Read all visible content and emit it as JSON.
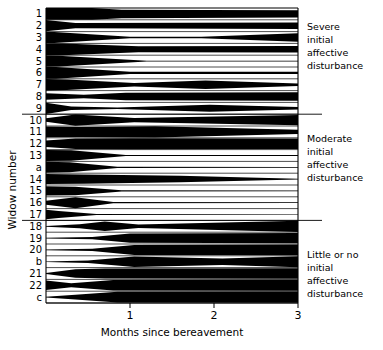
{
  "figure": {
    "title": "",
    "y_axis_title": "Widow number",
    "x_axis_title": "Months since bereavement"
  },
  "annotations": [
    {
      "id": "severe",
      "lines": [
        "Severe",
        "initial",
        "affective",
        "disturbance"
      ]
    },
    {
      "id": "moderate",
      "lines": [
        "Moderate",
        "initial",
        "affective",
        "disturbance"
      ]
    },
    {
      "id": "little",
      "lines": [
        "Little or no",
        "initial",
        "affective",
        "disturbance"
      ]
    }
  ],
  "chart_data": {
    "type": "area",
    "variant": "kite-diagram",
    "title": "",
    "xlabel": "Months since bereavement",
    "ylabel": "Widow number",
    "xlim": [
      0,
      3
    ],
    "xticks": [
      1,
      2,
      3
    ],
    "xticklabels": [
      "1",
      "2",
      "3"
    ],
    "grid": false,
    "legend": null,
    "fill_color": "#000000",
    "groups": [
      {
        "name": "Severe initial affective disturbance",
        "rows": [
          "1",
          "2",
          "3",
          "4",
          "5",
          "6",
          "7",
          "8",
          "9"
        ]
      },
      {
        "name": "Moderate initial affective disturbance",
        "rows": [
          "10",
          "11",
          "12",
          "13",
          "a",
          "14",
          "15",
          "16",
          "17"
        ]
      },
      {
        "name": "Little or no initial affective disturbance",
        "rows": [
          "18",
          "19",
          "20",
          "b",
          "21",
          "22",
          "c"
        ]
      }
    ],
    "series": [
      {
        "name": "1",
        "group": "severe",
        "x": [
          0.0,
          0.55,
          0.9,
          3.0
        ],
        "values": [
          1.0,
          1.0,
          0.72,
          0.6
        ]
      },
      {
        "name": "2",
        "group": "severe",
        "x": [
          0.0,
          0.35,
          3.0
        ],
        "values": [
          0.95,
          0.45,
          0.55
        ]
      },
      {
        "name": "3",
        "group": "severe",
        "x": [
          0.0,
          0.1,
          1.0,
          1.85,
          3.0
        ],
        "values": [
          0.95,
          0.95,
          0.14,
          0.12,
          0.7
        ]
      },
      {
        "name": "4",
        "group": "severe",
        "x": [
          0.0,
          0.2,
          1.1,
          3.0
        ],
        "values": [
          1.0,
          1.0,
          0.5,
          0.55
        ]
      },
      {
        "name": "5",
        "group": "severe",
        "x": [
          0.0,
          0.15,
          1.2,
          3.0
        ],
        "values": [
          0.95,
          0.92,
          0.08,
          0.06
        ]
      },
      {
        "name": "6",
        "group": "severe",
        "x": [
          0.0,
          0.12,
          1.0,
          3.0
        ],
        "values": [
          1.0,
          0.98,
          0.2,
          0.18
        ]
      },
      {
        "name": "7",
        "group": "severe",
        "x": [
          0.0,
          0.25,
          1.05,
          1.9,
          3.0
        ],
        "values": [
          0.98,
          0.9,
          0.3,
          0.72,
          0.22
        ]
      },
      {
        "name": "8",
        "group": "severe",
        "x": [
          0.0,
          0.45,
          0.95,
          3.0
        ],
        "values": [
          0.55,
          0.3,
          0.62,
          0.7
        ]
      },
      {
        "name": "9",
        "group": "severe",
        "x": [
          0.0,
          0.3,
          0.85,
          1.95,
          3.0
        ],
        "values": [
          0.95,
          0.3,
          0.12,
          0.6,
          0.2
        ]
      },
      {
        "name": "10",
        "group": "moderate",
        "x": [
          0.0,
          0.35,
          1.05,
          3.0
        ],
        "values": [
          0.3,
          0.95,
          0.35,
          0.88
        ]
      },
      {
        "name": "11",
        "group": "moderate",
        "x": [
          0.0,
          0.4,
          1.3,
          3.0
        ],
        "values": [
          0.9,
          0.85,
          0.95,
          0.35
        ]
      },
      {
        "name": "12",
        "group": "moderate",
        "x": [
          0.0,
          0.35,
          1.0,
          3.0
        ],
        "values": [
          0.55,
          0.88,
          0.92,
          0.88
        ]
      },
      {
        "name": "13",
        "group": "moderate",
        "x": [
          0.0,
          0.3,
          0.95,
          3.0
        ],
        "values": [
          0.92,
          0.88,
          0.1,
          0.08
        ]
      },
      {
        "name": "a",
        "group": "moderate",
        "x": [
          0.0,
          0.28,
          0.85,
          3.0
        ],
        "values": [
          0.92,
          0.85,
          0.1,
          0.06
        ]
      },
      {
        "name": "14",
        "group": "moderate",
        "x": [
          0.0,
          0.45,
          1.6,
          3.0
        ],
        "values": [
          0.85,
          0.8,
          0.55,
          0.08
        ]
      },
      {
        "name": "15",
        "group": "moderate",
        "x": [
          0.0,
          0.35,
          0.9,
          3.0
        ],
        "values": [
          0.8,
          0.72,
          0.1,
          0.08
        ]
      },
      {
        "name": "16",
        "group": "moderate",
        "x": [
          0.0,
          0.35,
          0.8,
          3.0
        ],
        "values": [
          0.35,
          0.92,
          0.1,
          0.06
        ]
      },
      {
        "name": "17",
        "group": "moderate",
        "x": [
          0.0,
          0.15,
          0.6,
          3.0
        ],
        "values": [
          0.8,
          0.6,
          0.08,
          0.06
        ]
      },
      {
        "name": "18",
        "group": "little",
        "x": [
          0.0,
          0.4,
          0.7,
          1.1,
          3.0
        ],
        "values": [
          0.06,
          0.35,
          0.8,
          0.3,
          0.95
        ]
      },
      {
        "name": "19",
        "group": "little",
        "x": [
          0.0,
          0.55,
          1.0,
          3.0
        ],
        "values": [
          0.06,
          0.2,
          0.78,
          0.88
        ]
      },
      {
        "name": "20",
        "group": "little",
        "x": [
          0.0,
          0.55,
          1.05,
          3.0
        ],
        "values": [
          0.05,
          0.18,
          0.85,
          0.92
        ]
      },
      {
        "name": "b",
        "group": "little",
        "x": [
          0.0,
          0.5,
          1.05,
          2.1,
          3.0
        ],
        "values": [
          0.05,
          0.2,
          0.88,
          0.55,
          0.92
        ]
      },
      {
        "name": "21",
        "group": "little",
        "x": [
          0.0,
          0.35,
          0.7,
          3.0
        ],
        "values": [
          0.1,
          0.7,
          0.85,
          0.88
        ]
      },
      {
        "name": "22",
        "group": "little",
        "x": [
          0.0,
          0.3,
          0.8,
          3.0
        ],
        "values": [
          0.8,
          0.35,
          0.9,
          0.92
        ]
      },
      {
        "name": "c",
        "group": "little",
        "x": [
          0.0,
          0.35,
          0.85,
          3.0
        ],
        "values": [
          0.06,
          0.4,
          0.9,
          0.95
        ]
      }
    ]
  }
}
